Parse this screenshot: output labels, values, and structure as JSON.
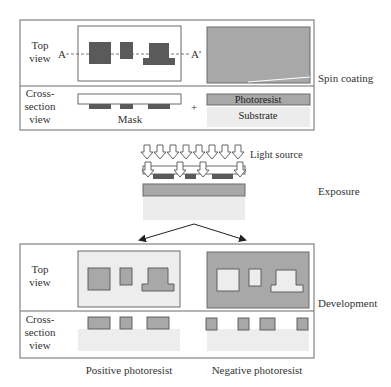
{
  "colors": {
    "dark_mask": "#5a5a5a",
    "resist_gray": "#a8a8a8",
    "substrate_light": "#ececec",
    "panel_border": "#6a6a6a",
    "bg_light": "#ededed"
  },
  "panel_top": {
    "row1_label_line1": "Top",
    "row1_label_line2": "view",
    "row2_label_line1": "Cross-",
    "row2_label_line2": "section",
    "row2_label_line3": "view",
    "marker_a": "A",
    "marker_a_prime": "A'",
    "mask_label": "Mask",
    "plus_sign": "+",
    "photoresist_label": "Photoresist",
    "substrate_label": "Substrate",
    "step_label": "Spin coating"
  },
  "exposure": {
    "light_label": "Light source",
    "step_label": "Exposure"
  },
  "panel_bottom": {
    "row1_label_line1": "Top",
    "row1_label_line2": "view",
    "row2_label_line1": "Cross-",
    "row2_label_line2": "section",
    "row2_label_line3": "view",
    "step_label": "Development",
    "positive_label": "Positive photoresist",
    "negative_label": "Negative photoresist"
  }
}
